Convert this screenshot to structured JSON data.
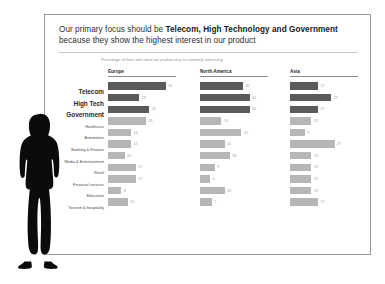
{
  "slide": {
    "title_line1_plain": "Our primary focus should be ",
    "title_line1_strong": "Telecom, High Technology and Government",
    "title_line2": "because they show the highest interest in our product",
    "subtitle": "Percentage of firms who rated our product very or extremely interesting",
    "accent_color": "#5b5b5b",
    "bar_color": "#b6b6b6",
    "rule_color": "#c9c9c9"
  },
  "categories": [
    {
      "label": "Telecom",
      "highlight": true
    },
    {
      "label": "High Tech",
      "highlight": true
    },
    {
      "label": "Government",
      "highlight": true
    },
    {
      "label": "Healthcare",
      "highlight": false
    },
    {
      "label": "Automotive",
      "highlight": false
    },
    {
      "label": "Banking & Finance",
      "highlight": false
    },
    {
      "label": "Media & Entertainment",
      "highlight": false
    },
    {
      "label": "Retail",
      "highlight": false
    },
    {
      "label": "Financial services",
      "highlight": false
    },
    {
      "label": "Education",
      "highlight": false
    },
    {
      "label": "Tourism & hospitality",
      "highlight": false
    }
  ],
  "panels": [
    {
      "name": "europe",
      "header": "Europe"
    },
    {
      "name": "north_america",
      "header": "North America"
    },
    {
      "name": "asia",
      "header": "Asia"
    }
  ],
  "chart_data": {
    "type": "bar",
    "title": "Our primary focus should be Telecom, High Technology and Government because they show the highest interest in our product",
    "subtitle": "Percentage of firms who rated our product very or extremely interesting",
    "xlabel": "",
    "ylabel": "",
    "xlim": [
      0,
      40
    ],
    "grid": false,
    "legend": "none",
    "orientation": "horizontal",
    "panel_layout": "small-multiples",
    "categories": [
      "Telecom",
      "High Tech",
      "Government",
      "Healthcare",
      "Automotive",
      "Banking & Finance",
      "Media & Entertainment",
      "Retail",
      "Financial services",
      "Education",
      "Tourism & hospitality"
    ],
    "highlighted_categories": [
      "Telecom",
      "High Tech",
      "Government"
    ],
    "series": [
      {
        "name": "Europe",
        "values": [
          35,
          19,
          25,
          23,
          14,
          14,
          10,
          17,
          17,
          8,
          12
        ],
        "highlight_flags": [
          true,
          true,
          true,
          false,
          false,
          false,
          false,
          false,
          false,
          false,
          false
        ]
      },
      {
        "name": "North America",
        "values": [
          26,
          30,
          30,
          13,
          25,
          15,
          18,
          9,
          6,
          15,
          7
        ],
        "highlight_flags": [
          true,
          true,
          true,
          false,
          false,
          false,
          false,
          false,
          false,
          false,
          false
        ]
      },
      {
        "name": "Asia",
        "values": [
          17,
          25,
          17,
          13,
          9,
          27,
          13,
          13,
          13,
          13,
          17
        ],
        "highlight_flags": [
          true,
          true,
          true,
          false,
          false,
          false,
          false,
          false,
          false,
          false,
          false
        ]
      }
    ]
  }
}
